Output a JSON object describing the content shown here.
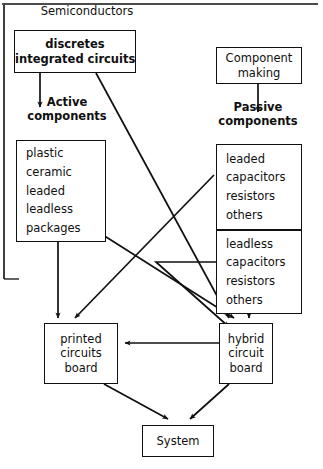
{
  "diagram": {
    "type": "flowchart",
    "stroke_color": "#101010",
    "background_color": "#ffffff",
    "nodes": {
      "semiconductors": {
        "label": "Semiconductors",
        "shape": "plain-label"
      },
      "discretes": {
        "lines": [
          "discretes",
          "integrated  circuits"
        ],
        "shape": "box"
      },
      "active_components": {
        "lines": [
          "Active",
          "components"
        ],
        "shape": "plain-label"
      },
      "active_list": {
        "items": [
          "plastic",
          "ceramic",
          "leaded",
          "leadless",
          "packages"
        ],
        "shape": "box"
      },
      "component_making": {
        "lines": [
          "Component",
          "making"
        ],
        "shape": "box"
      },
      "passive_components": {
        "lines": [
          "Passive",
          "components"
        ],
        "shape": "plain-label"
      },
      "leaded_group": {
        "items": [
          "leaded",
          "capacitors",
          "resistors",
          "others"
        ],
        "shape": "box"
      },
      "leadless_group": {
        "items": [
          "leadless",
          "capacitors",
          "resistors",
          "others"
        ],
        "shape": "box"
      },
      "printed_circuits_board": {
        "lines": [
          "printed",
          "circuits",
          "board"
        ],
        "shape": "box"
      },
      "hybrid_circuit_board": {
        "lines": [
          "hybrid",
          "circuit",
          "board"
        ],
        "shape": "box"
      },
      "system": {
        "lines": [
          "System"
        ],
        "shape": "box"
      }
    },
    "edges": [
      {
        "from": "discretes",
        "to": "active_components",
        "style": "straight-down"
      },
      {
        "from": "discretes",
        "to": "hybrid_circuit_board",
        "style": "diagonal"
      },
      {
        "from": "component_making",
        "to": "passive_components",
        "style": "straight-down"
      },
      {
        "from": "active_list",
        "to": "printed_circuits_board",
        "style": "straight-down"
      },
      {
        "from": "active_list",
        "to": "hybrid_circuit_board",
        "style": "diagonal"
      },
      {
        "from": "leaded_group",
        "to": "printed_circuits_board",
        "style": "diagonal"
      },
      {
        "from": "leadless_group",
        "to": "hybrid_circuit_board",
        "style": "elbow"
      },
      {
        "from": "leadless_group",
        "to": "hybrid_circuit_board",
        "style": "straight-down"
      },
      {
        "from": "hybrid_circuit_board",
        "to": "printed_circuits_board",
        "style": "horizontal"
      },
      {
        "from": "printed_circuits_board",
        "to": "system",
        "style": "diagonal"
      },
      {
        "from": "hybrid_circuit_board",
        "to": "system",
        "style": "diagonal"
      }
    ]
  }
}
